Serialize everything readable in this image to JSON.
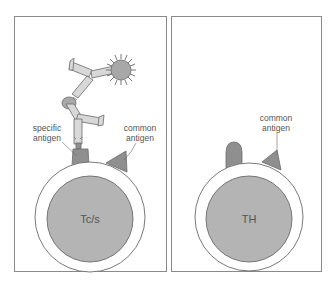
{
  "colors": {
    "background": "#ffffff",
    "panel_border": "#8a8a8a",
    "cell_outline": "#6a6a6a",
    "cell_membrane": "#ffffff",
    "nucleus_fill": "#b4b4b4",
    "antigen_fill": "#8f8f8f",
    "antibody_fill": "#d8d8d8",
    "particle_fill": "#a8a8a8",
    "text": "#555555"
  },
  "panels": [
    {
      "id": "left",
      "cell_label": "Tc/s",
      "labels": {
        "specific_antigen_line1": "specific",
        "specific_antigen_line2": "antigen",
        "common_antigen_line1": "common",
        "common_antigen_line2": "antigen"
      },
      "has_antibody_complex": true
    },
    {
      "id": "right",
      "cell_label": "TH",
      "labels": {
        "common_antigen_line1": "common",
        "common_antigen_line2": "antigen"
      },
      "has_antibody_complex": false
    }
  ]
}
